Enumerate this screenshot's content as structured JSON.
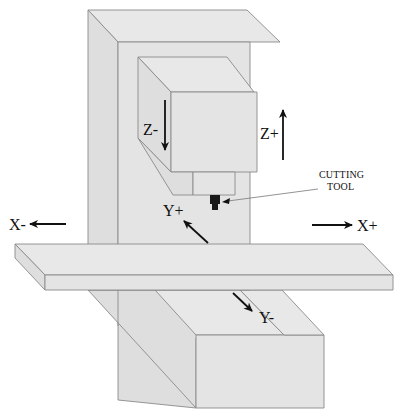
{
  "diagram": {
    "type": "milling-machine-axes",
    "labels": {
      "z_minus": "Z-",
      "z_plus": "Z+",
      "x_minus": "X-",
      "x_plus": "X+",
      "y_plus": "Y+",
      "y_minus": "Y-",
      "cutting_tool_line1": "CUTTING",
      "cutting_tool_line2": "TOOL"
    },
    "parts": [
      "column",
      "spindle-head",
      "quill",
      "cutting-tool",
      "table",
      "base"
    ],
    "colors": {
      "face": "#e4e4e4",
      "edge": "#8a8a8a",
      "arrow": "#111111",
      "tool": "#1a1a1a"
    }
  }
}
